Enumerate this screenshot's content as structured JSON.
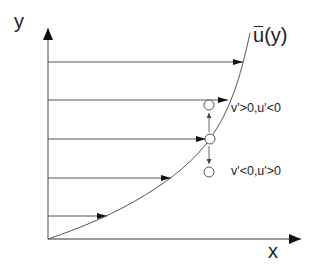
{
  "labels": {
    "y_axis": "y",
    "x_axis": "x",
    "curve_base": "u",
    "curve_suffix": "(y)",
    "annotation_upper": "v'>0,u'<0",
    "annotation_lower": "v'<0,u'>0"
  },
  "colors": {
    "line": "#555555",
    "axis": "#666666",
    "arrowhead": "#111111",
    "text": "#222222"
  }
}
